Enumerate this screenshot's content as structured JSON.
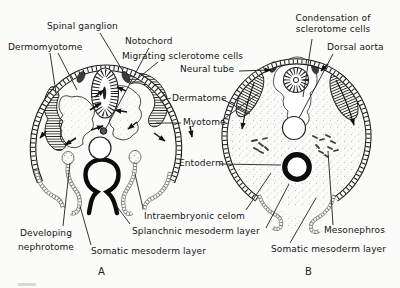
{
  "figure": {
    "colors": {
      "ink": "#1a1a1a",
      "paper": "#fbfbf9",
      "leader": "#2b2b2b",
      "hatch": "#2b2b2b",
      "stipple": "#8f8f8f"
    },
    "panels": [
      {
        "id": "A",
        "letter": "A"
      },
      {
        "id": "B",
        "letter": "B"
      }
    ],
    "labels": {
      "spinal_ganglion": "Spinal ganglion",
      "dermomyotome": "Dermomyotome",
      "notochord": "Notochord",
      "migrating_sclerotome": "Migrating sclerotome cells",
      "condensation": "Condensation of\nsclerotome cells",
      "dorsal_aorta": "Dorsal aorta",
      "neural_tube": "Neural tube",
      "dermatome": "Dermatome",
      "myotome": "Myotome",
      "entoderm": "Entoderm",
      "developing_nephrotome": "Developing\nnephrotome",
      "intraembryonic_celom": "Intraembryonic celom",
      "splanchnic_mesoderm": "Splanchnic mesoderm layer",
      "somatic_mesoderm_left": "Somatic mesoderm layer",
      "mesonephros": "Mesonephros",
      "somatic_mesoderm_right": "Somatic mesoderm layer",
      "panel_a": "A",
      "panel_b": "B"
    }
  }
}
